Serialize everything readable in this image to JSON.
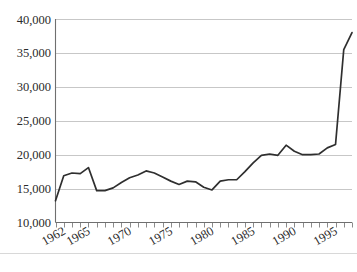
{
  "chart_data": {
    "type": "line",
    "title": "",
    "subtitle": "",
    "xlabel": "",
    "ylabel": "",
    "grid": true,
    "legend": "none",
    "xlim": [
      1962,
      1998
    ],
    "ylim": [
      10000,
      40000
    ],
    "ytick_labels": [
      "40,000",
      "35,000",
      "30,000",
      "25,000",
      "20,000",
      "15,000",
      "10,000"
    ],
    "ytick_values": [
      40000,
      35000,
      30000,
      25000,
      20000,
      15000,
      10000
    ],
    "xtick_labels": [
      "1962",
      "1965",
      "1970",
      "1975",
      "1980",
      "1985",
      "1990",
      "1995"
    ],
    "xtick_values": [
      1962,
      1965,
      1970,
      1975,
      1980,
      1985,
      1990,
      1995
    ],
    "x": [
      1962,
      1963,
      1964,
      1965,
      1966,
      1967,
      1968,
      1969,
      1970,
      1971,
      1972,
      1973,
      1974,
      1975,
      1976,
      1977,
      1978,
      1979,
      1980,
      1981,
      1982,
      1983,
      1984,
      1985,
      1986,
      1987,
      1988,
      1989,
      1990,
      1991,
      1992,
      1993,
      1994,
      1995,
      1996,
      1997,
      1998
    ],
    "series": [
      {
        "name": "value",
        "color": "#2f2f2f",
        "values": [
          13200,
          16900,
          17300,
          17200,
          18100,
          14700,
          14700,
          15100,
          15900,
          16600,
          17000,
          17600,
          17300,
          16700,
          16100,
          15600,
          16100,
          16000,
          15200,
          14800,
          16100,
          16300,
          16300,
          17500,
          18800,
          19900,
          20100,
          19900,
          21400,
          20500,
          20000,
          20000,
          20100,
          21000,
          21500,
          35500,
          38000
        ]
      }
    ]
  },
  "axes": {
    "x_minor_tick_step": 1,
    "x_label_rotation_deg": -30
  }
}
